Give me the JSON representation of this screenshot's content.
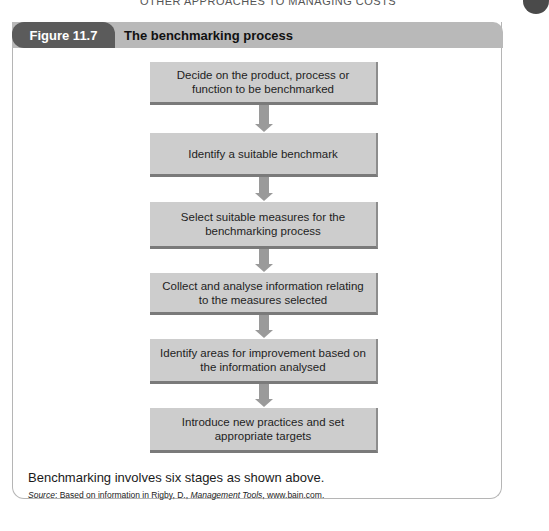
{
  "running_head": "OTHER APPROACHES TO MANAGING COSTS",
  "figure": {
    "label": "Figure 11.7",
    "title": "The benchmarking process"
  },
  "steps": [
    {
      "text": "Decide on the product, process or function to be benchmarked"
    },
    {
      "text": "Identify a suitable benchmark"
    },
    {
      "text": "Select suitable measures for the benchmarking process"
    },
    {
      "text": "Collect and analyse information relating to the measures selected"
    },
    {
      "text": "Identify areas for improvement based on the information analysed"
    },
    {
      "text": "Introduce new practices and set appropriate targets"
    }
  ],
  "caption": "Benchmarking involves six stages as shown above.",
  "source": {
    "prefix": "Source",
    "text_before": ": Based on information in Rigby, D., ",
    "title": "Management Tools",
    "text_after": ", www.bain.com."
  },
  "colors": {
    "figure_label_bg": "#5b5b5b",
    "header_bar_bg": "#b9b9b9",
    "box_bg": "#cdcdcd",
    "arrow": "#9a9a9a"
  }
}
